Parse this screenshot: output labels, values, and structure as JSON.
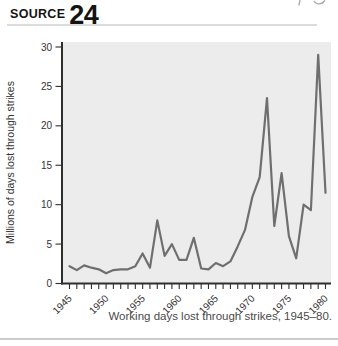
{
  "header": {
    "source_label": "SOURCE",
    "source_number": "24"
  },
  "chart_data": {
    "type": "line",
    "title": "",
    "caption": "Working days lost through strikes, 1945–80.",
    "ylabel": "Millions of days lost through strikes",
    "xlabel": "",
    "x": [
      1945,
      1946,
      1947,
      1948,
      1949,
      1950,
      1951,
      1952,
      1953,
      1954,
      1955,
      1956,
      1957,
      1958,
      1959,
      1960,
      1961,
      1962,
      1963,
      1964,
      1965,
      1966,
      1967,
      1968,
      1969,
      1970,
      1971,
      1972,
      1973,
      1974,
      1975,
      1976,
      1977,
      1978,
      1979,
      1980
    ],
    "values": [
      2.2,
      1.7,
      2.3,
      2.0,
      1.8,
      1.3,
      1.7,
      1.8,
      1.8,
      2.2,
      3.8,
      2.0,
      8.0,
      3.5,
      5.0,
      3.0,
      3.0,
      5.8,
      1.9,
      1.8,
      2.6,
      2.2,
      2.8,
      4.7,
      6.8,
      11.0,
      13.5,
      23.5,
      7.3,
      14.0,
      6.0,
      3.2,
      10.0,
      9.3,
      29.0,
      11.5
    ],
    "x_tick_labels": [
      "1945",
      "1950",
      "1955",
      "1960",
      "1965",
      "1970",
      "1975",
      "1980"
    ],
    "y_ticks": [
      0,
      5,
      10,
      15,
      20,
      25,
      30
    ],
    "xlim": [
      1945,
      1980
    ],
    "ylim": [
      0,
      30
    ],
    "grid": false,
    "legend": "none",
    "line_color": "#6f6f6f",
    "plot_bg_color": "#ececec",
    "axis_color": "#2f2f2f",
    "label_color": "#333333"
  }
}
